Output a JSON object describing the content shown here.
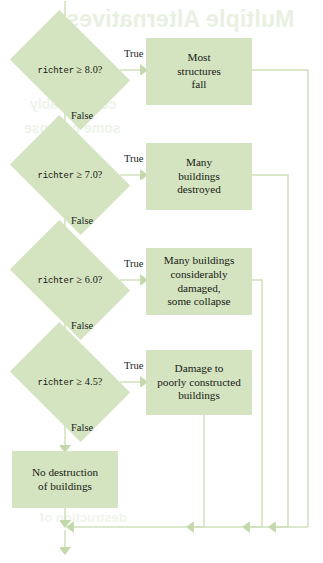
{
  "diagram": {
    "type": "flowchart",
    "title_showthrough": "Multiple Alternatives",
    "showthrough_line_1": "considerably",
    "showthrough_line_2": "some collapse",
    "showthrough_line_3": "destruction of",
    "colors": {
      "node_fill": "#d4e3c0",
      "connector": "#cfe0bb",
      "text": "#171a14"
    },
    "entry_arrow": "arrow-down",
    "exit_arrow": "arrow-down",
    "labels": {
      "true": "True",
      "false": "False"
    },
    "decisions": [
      {
        "id": "d1",
        "variable": "richter",
        "comparison": "≥ 8.0?",
        "true_label": "True",
        "false_label": "False",
        "outcome_lines": [
          "Most",
          "structures",
          "fall"
        ]
      },
      {
        "id": "d2",
        "variable": "richter",
        "comparison": "≥ 7.0?",
        "true_label": "True",
        "false_label": "False",
        "outcome_lines": [
          "Many",
          "buildings",
          "destroyed"
        ]
      },
      {
        "id": "d3",
        "variable": "richter",
        "comparison": "≥ 6.0?",
        "true_label": "True",
        "false_label": "False",
        "outcome_lines": [
          "Many buildings",
          "considerably",
          "damaged,",
          "some collapse"
        ]
      },
      {
        "id": "d4",
        "variable": "richter",
        "comparison": "≥ 4.5?",
        "true_label": "True",
        "false_label": "False",
        "outcome_lines": [
          "Damage to",
          "poorly constructed",
          "buildings"
        ]
      }
    ],
    "default_outcome": {
      "id": "d5",
      "lines": [
        "No destruction",
        "of buildings"
      ]
    }
  }
}
